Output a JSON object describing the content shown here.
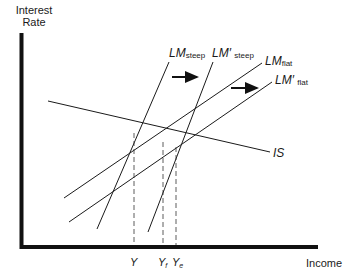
{
  "diagram": {
    "axes": {
      "y_label_line1": "Interest",
      "y_label_line2": "Rate",
      "x_label": "Income"
    },
    "curves": {
      "lm_steep": {
        "main": "LM",
        "sub": "steep"
      },
      "lm_steep_prime": {
        "main": "LM′",
        "sub": "steep"
      },
      "lm_flat": {
        "main": "LM",
        "sub": "flat"
      },
      "lm_flat_prime": {
        "main": "LM′",
        "sub": "flat"
      },
      "is": {
        "main": "IS"
      }
    },
    "x_ticks": {
      "y": {
        "main": "Y"
      },
      "yf": {
        "main": "Y",
        "sub": "f"
      },
      "ye": {
        "main": "Y",
        "sub": "e"
      }
    },
    "arrows": [
      "shift-right",
      "shift-right"
    ],
    "colors": {
      "line": "#1a1a1a",
      "axis": "#111111",
      "background": "#ffffff"
    }
  }
}
